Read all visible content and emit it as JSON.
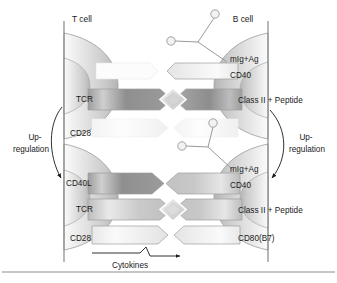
{
  "figure": {
    "width": 337,
    "height": 283
  },
  "headers": {
    "t_cell": "T cell",
    "b_cell": "B cell"
  },
  "t_cell_labels": {
    "tcr_upper": "TCR",
    "cd28_upper": "CD28",
    "cd40l": "CD40L",
    "tcr_lower": "TCR",
    "cd28_lower": "CD28"
  },
  "b_cell_labels": {
    "mig_ag_upper": "mIg+Ag",
    "cd40_upper": "CD40",
    "class2_upper": "Class II + Peptide",
    "mig_ag_lower": "mIg+Ag",
    "cd40_lower": "CD40",
    "class2_lower": "Class II + Peptide",
    "cd80_b7": "CD80(B7)"
  },
  "annotations": {
    "upregulation_left_line1": "Up-",
    "upregulation_left_line2": "regulation",
    "upregulation_right_line1": "Up-",
    "upregulation_right_line2": "regulation",
    "cytokines": "Cytokines"
  },
  "colors": {
    "background": "#ffffff",
    "text": "#1a1a1a",
    "cell_membrane": "#7d7d7d",
    "receptor_gray_dark": "#8e8e8e",
    "receptor_gray_mid": "#c4c4c4",
    "receptor_gray_light": "#efefef",
    "arrow": "#1a1a1a",
    "rule": "#8c8c8c"
  }
}
